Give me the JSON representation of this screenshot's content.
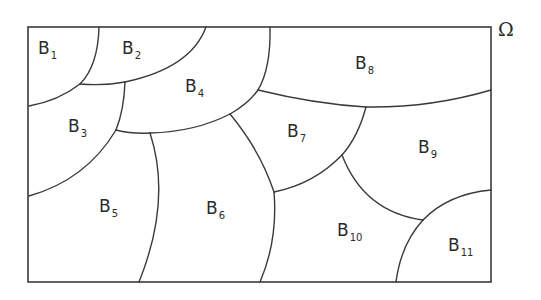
{
  "diagram": {
    "domain_symbol": "Ω",
    "domain_label_meaning": "domain partitioned into subregions",
    "line_color": "#3a3a3a",
    "background": "#ffffff",
    "regions": [
      {
        "id": "B1",
        "base": "B",
        "sub": "1",
        "x": 38,
        "y": 40
      },
      {
        "id": "B2",
        "base": "B",
        "sub": "2",
        "x": 122,
        "y": 40
      },
      {
        "id": "B3",
        "base": "B",
        "sub": "3",
        "x": 68,
        "y": 118
      },
      {
        "id": "B4",
        "base": "B",
        "sub": "4",
        "x": 185,
        "y": 78
      },
      {
        "id": "B5",
        "base": "B",
        "sub": "5",
        "x": 99,
        "y": 198
      },
      {
        "id": "B6",
        "base": "B",
        "sub": "6",
        "x": 206,
        "y": 200
      },
      {
        "id": "B7",
        "base": "B",
        "sub": "7",
        "x": 287,
        "y": 123
      },
      {
        "id": "B8",
        "base": "B",
        "sub": "8",
        "x": 355,
        "y": 55
      },
      {
        "id": "B9",
        "base": "B",
        "sub": "9",
        "x": 418,
        "y": 139
      },
      {
        "id": "B10",
        "base": "B",
        "sub": "10",
        "x": 337,
        "y": 222
      },
      {
        "id": "B11",
        "base": "B",
        "sub": "11",
        "x": 448,
        "y": 237
      }
    ]
  }
}
